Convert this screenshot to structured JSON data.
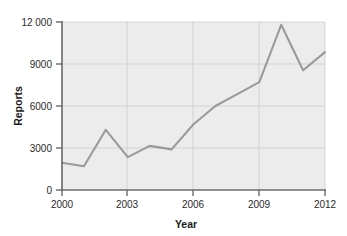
{
  "chart_data": {
    "type": "line",
    "title": "",
    "xlabel": "Year",
    "ylabel": "Reports",
    "x": [
      2000,
      2001,
      2002,
      2003,
      2004,
      2005,
      2006,
      2007,
      2008,
      2009,
      2010,
      2011,
      2012
    ],
    "values": [
      1950,
      1700,
      4300,
      2350,
      3150,
      2900,
      4700,
      6000,
      6850,
      7700,
      11800,
      8550,
      9850
    ],
    "series": [
      {
        "name": "Reports",
        "values": [
          1950,
          1700,
          4300,
          2350,
          3150,
          2900,
          4700,
          6000,
          6850,
          7700,
          11800,
          8550,
          9850
        ],
        "color": "#9a9a9a"
      }
    ],
    "xlim": [
      2000,
      2012
    ],
    "ylim": [
      0,
      12000
    ],
    "xticks": [
      2000,
      2003,
      2006,
      2009,
      2012
    ],
    "xtick_labels": [
      "2000",
      "2003",
      "2006",
      "2009",
      "2012"
    ],
    "yticks": [
      0,
      3000,
      6000,
      9000,
      12000
    ],
    "ytick_labels": [
      "0",
      "3000",
      "6000",
      "9000",
      "12 000"
    ],
    "grid": true,
    "grid_axis": "both",
    "legend": false,
    "legend_position": "none",
    "plot_background": "#ececec",
    "gridline_color": "#c9c9c9",
    "axis_color": "#6b6b6b",
    "line_color": "#9a9a9a"
  }
}
